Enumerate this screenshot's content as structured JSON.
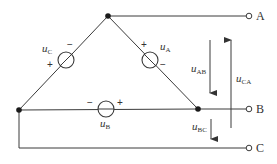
{
  "diagram": {
    "type": "three-phase delta-connected voltage sources",
    "terminals": [
      {
        "id": "A",
        "label": "A"
      },
      {
        "id": "B",
        "label": "B"
      },
      {
        "id": "C",
        "label": "C"
      }
    ],
    "sources": [
      {
        "id": "uA",
        "symbol": "u",
        "subscript": "A",
        "plus": "+",
        "minus": "−"
      },
      {
        "id": "uB",
        "symbol": "u",
        "subscript": "B",
        "plus": "+",
        "minus": "−"
      },
      {
        "id": "uC",
        "symbol": "u",
        "subscript": "C",
        "plus": "+",
        "minus": "−"
      }
    ],
    "line_voltages": [
      {
        "id": "uAB",
        "symbol": "u",
        "subscript": "AB",
        "direction": "down"
      },
      {
        "id": "uBC",
        "symbol": "u",
        "subscript": "BC",
        "direction": "down"
      },
      {
        "id": "uCA",
        "symbol": "u",
        "subscript": "CA",
        "direction": "up"
      }
    ]
  }
}
